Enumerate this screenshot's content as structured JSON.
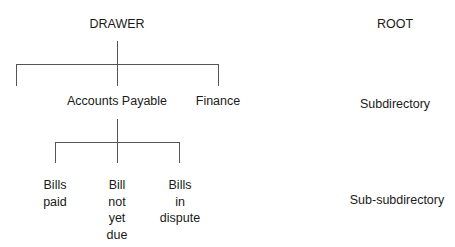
{
  "tree": {
    "root": {
      "label": "DRAWER"
    },
    "level1": [
      {
        "label": ""
      },
      {
        "label": "Accounts Payable"
      },
      {
        "label": "Finance"
      }
    ],
    "level2": [
      {
        "lines": [
          "Bills",
          "paid"
        ]
      },
      {
        "lines": [
          "Bill",
          "not",
          "yet",
          "due"
        ]
      },
      {
        "lines": [
          "Bills",
          "in",
          "dispute"
        ]
      }
    ]
  },
  "legend": {
    "root": "ROOT",
    "level1": "Subdirectory",
    "level2": "Sub-subdirectory"
  },
  "colors": {
    "line": "#555555",
    "text": "#1a1a1a",
    "background": "#ffffff"
  }
}
